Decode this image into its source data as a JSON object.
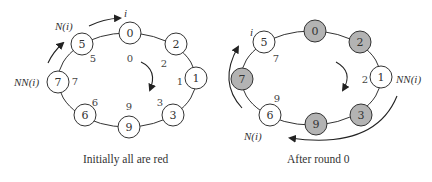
{
  "colors": {
    "white_node": "#ffffff",
    "gray_node": "#b3b3b3",
    "stroke": "#333333"
  },
  "left": {
    "caption": "Initially all are red",
    "label_i": "i",
    "label_N": "N(i)",
    "label_NN": "NN(i)",
    "nodes": [
      {
        "id": "0",
        "x": 130,
        "y": 33,
        "fill": "white"
      },
      {
        "id": "2",
        "x": 176,
        "y": 44,
        "fill": "white"
      },
      {
        "id": "1",
        "x": 196,
        "y": 78,
        "fill": "white"
      },
      {
        "id": "3",
        "x": 173,
        "y": 115,
        "fill": "white"
      },
      {
        "id": "9",
        "x": 129,
        "y": 127,
        "fill": "white"
      },
      {
        "id": "6",
        "x": 85,
        "y": 115,
        "fill": "white"
      },
      {
        "id": "7",
        "x": 58,
        "y": 82,
        "fill": "white"
      },
      {
        "id": "5",
        "x": 82,
        "y": 44,
        "fill": "white"
      }
    ],
    "values": [
      {
        "text": "0",
        "x": 130,
        "y": 62
      },
      {
        "text": "2",
        "x": 164,
        "y": 67
      },
      {
        "text": "1",
        "x": 180,
        "y": 85
      },
      {
        "text": "3",
        "x": 160,
        "y": 106
      },
      {
        "text": "9",
        "x": 129,
        "y": 110
      },
      {
        "text": "6",
        "x": 95,
        "y": 106
      },
      {
        "text": "7",
        "x": 75,
        "y": 85
      },
      {
        "text": "5",
        "x": 93,
        "y": 62
      }
    ]
  },
  "right": {
    "caption": "After round 0",
    "label_i": "i",
    "label_N": "N(i)",
    "label_NN": "NN(i)",
    "nodes": [
      {
        "id": "0",
        "x": 315,
        "y": 31,
        "fill": "gray"
      },
      {
        "id": "2",
        "x": 360,
        "y": 42,
        "fill": "gray"
      },
      {
        "id": "1",
        "x": 381,
        "y": 77,
        "fill": "white"
      },
      {
        "id": "3",
        "x": 361,
        "y": 115,
        "fill": "gray"
      },
      {
        "id": "9",
        "x": 316,
        "y": 124,
        "fill": "gray"
      },
      {
        "id": "6",
        "x": 270,
        "y": 115,
        "fill": "white"
      },
      {
        "id": "7",
        "x": 242,
        "y": 79,
        "fill": "gray"
      },
      {
        "id": "5",
        "x": 264,
        "y": 42,
        "fill": "white"
      }
    ],
    "values": [
      {
        "text": "7",
        "x": 276,
        "y": 62
      },
      {
        "text": "2",
        "x": 365,
        "y": 83
      },
      {
        "text": "9",
        "x": 277,
        "y": 102
      }
    ]
  }
}
